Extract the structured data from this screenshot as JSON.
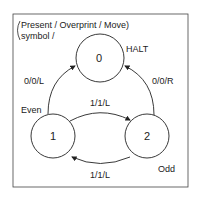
{
  "legend": {
    "line1": "Present / Overprint / Move)",
    "line2": "symbol /"
  },
  "states": [
    {
      "id": "0",
      "label": "0",
      "annotation": "HALT"
    },
    {
      "id": "1",
      "label": "1",
      "annotation": "Even"
    },
    {
      "id": "2",
      "label": "2",
      "annotation": "Odd"
    }
  ],
  "transitions": [
    {
      "from": "1",
      "to": "0",
      "label": "0/0/L"
    },
    {
      "from": "2",
      "to": "0",
      "label": "0/0/R"
    },
    {
      "from": "1",
      "to": "2",
      "label": "1/1/L"
    },
    {
      "from": "2",
      "to": "1",
      "label": "1/1/L"
    }
  ],
  "colors": {
    "stroke": "#222222",
    "background": "#ffffff"
  }
}
